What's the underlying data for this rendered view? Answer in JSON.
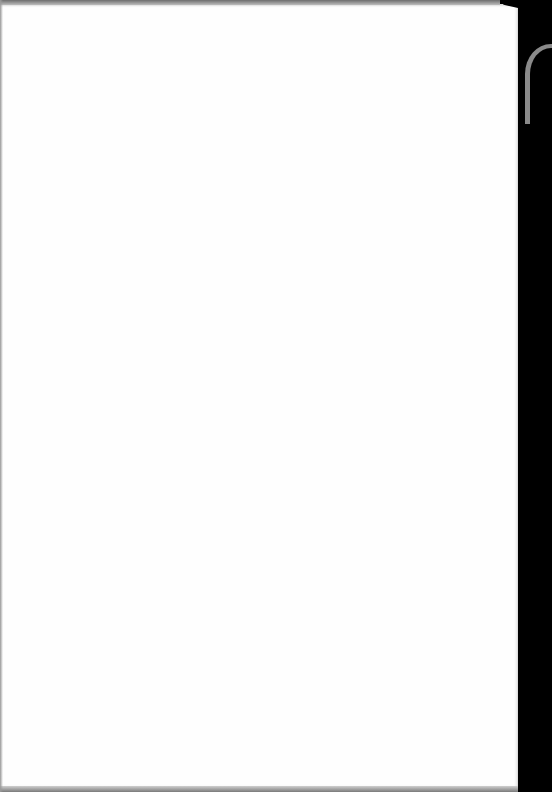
{
  "document": {
    "type": "scanned-page",
    "content": "",
    "blank": true
  },
  "colors": {
    "paper": "#fefefe",
    "background": "#000000",
    "edge": "#8a8a8a"
  }
}
